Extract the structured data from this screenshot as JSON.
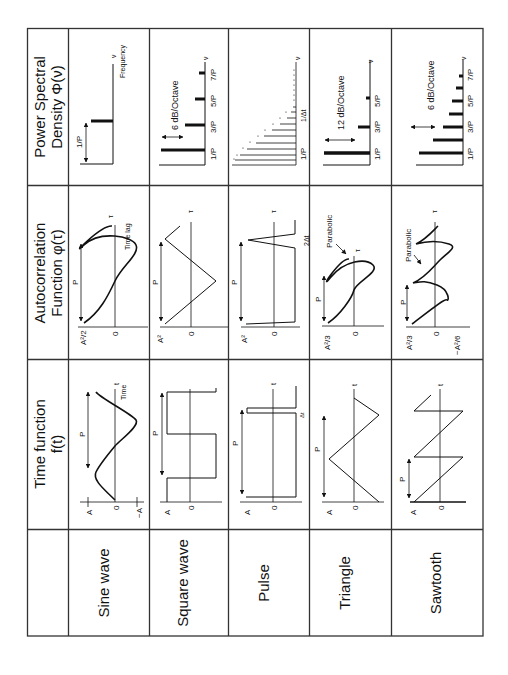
{
  "headers": {
    "psd": {
      "line1": "Power Spectral",
      "line2": "Density Φ(ν)"
    },
    "autocorr": {
      "line1": "Autocorrelation",
      "line2": "Function  φ(τ)"
    },
    "time": {
      "line1": "Time function",
      "line2": "f(t)"
    }
  },
  "waveforms": [
    {
      "name": "Sine wave"
    },
    {
      "name": "Square wave"
    },
    {
      "name": "Pulse"
    },
    {
      "name": "Triangle"
    },
    {
      "name": "Sawtooth"
    }
  ],
  "labels": {
    "A": "A",
    "minusA": "−A",
    "zero": "0",
    "P": "P",
    "t": "t",
    "tau": "τ",
    "nu": "ν",
    "time": "Time",
    "time_lag": "Time lag",
    "frequency": "Frequency",
    "dt": "Δt",
    "two_dt": "2Δt",
    "inv_dt": "1/Δt",
    "A2_half": "A²/2",
    "A2": "A²",
    "A2_third": "A²/3",
    "neg_A2_sixth": "−A²/6",
    "parabolic": "Parabolic",
    "f1": "1/P",
    "f3": "3/P",
    "f5": "5/P",
    "f7": "7/P",
    "db6": "6 dB/Octave",
    "db12": "12 dB/Octave"
  },
  "colors": {
    "line": "#111111",
    "grid": "#333333",
    "background": "#ffffff"
  }
}
